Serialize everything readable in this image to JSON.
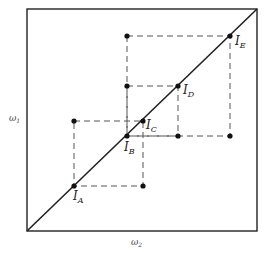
{
  "diagram": {
    "axes": {
      "x_label": "ω",
      "x_sub": "2",
      "y_label": "ω",
      "y_sub": "1"
    },
    "points": [
      {
        "id": "A",
        "label": "I",
        "sub": "A",
        "x": 74,
        "y": 186
      },
      {
        "id": "B",
        "label": "I",
        "sub": "B",
        "x": 127,
        "y": 136
      },
      {
        "id": "C",
        "label": "I",
        "sub": "C",
        "x": 143,
        "y": 121
      },
      {
        "id": "D",
        "label": "I",
        "sub": "D",
        "x": 178,
        "y": 86
      },
      {
        "id": "E",
        "label": "I",
        "sub": "E",
        "x": 230,
        "y": 36
      }
    ],
    "colors": {
      "stroke": "#222222",
      "dashed": "#555555",
      "background": "#ffffff"
    }
  }
}
